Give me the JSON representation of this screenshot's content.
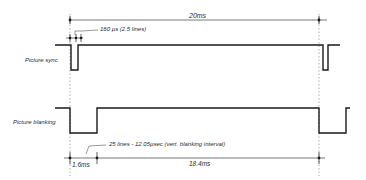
{
  "diagram": {
    "colors": {
      "line": "#1a1a1a",
      "thin": "#555555",
      "dotted": "#9a9a9a",
      "background": "#ffffff"
    },
    "labels": {
      "total_period": "20ms",
      "sync_pulse_width": "160 µs (2.5 lines)",
      "picture_sync": "Picture sync",
      "picture_blanking": "Picture blanking",
      "blanking_interval": "25 lines - 12.05µsec (vert. blanking interval)",
      "blanking_duration": "1.6ms",
      "active_duration": "18.4ms"
    },
    "signals": [
      {
        "name": "Picture sync",
        "pulses": [
          "at field start (left)",
          "at field end (right)"
        ],
        "pulse_width": "160 µs (2.5 lines)"
      },
      {
        "name": "Picture blanking",
        "pulses": [
          "1.6ms low at field start",
          "low at field end"
        ],
        "interval": "25 lines - 12.05µsec (vert. blanking interval)"
      }
    ],
    "dimensions": [
      {
        "label": "20ms",
        "span": "field period"
      },
      {
        "label": "160 µs (2.5 lines)",
        "span": "sync pulse"
      },
      {
        "label": "1.6ms",
        "span": "vertical blanking"
      },
      {
        "label": "18.4ms",
        "span": "active picture"
      }
    ]
  }
}
